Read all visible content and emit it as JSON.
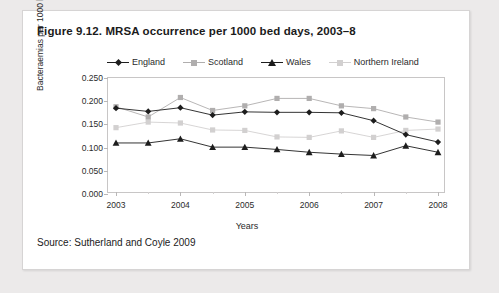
{
  "figure": {
    "title": "Figure 9.12. MRSA occurrence per 1000 bed days, 2003–8",
    "source": "Source: Sutherland and Coyle 2009"
  },
  "legend": {
    "position": "top",
    "items": [
      {
        "label": "England",
        "marker": "diamond",
        "color": "#1d1d1d"
      },
      {
        "label": "Scotland",
        "marker": "square",
        "color": "#b0aeae"
      },
      {
        "label": "Wales",
        "marker": "triangle",
        "color": "#1d1d1d"
      },
      {
        "label": "Northern Ireland",
        "marker": "square",
        "color": "#d2d0d0"
      }
    ]
  },
  "chart_data": {
    "type": "line",
    "title": "Figure 9.12. MRSA occurrence per 1000 bed days, 2003–8",
    "xlabel": "Years",
    "ylabel": "Bacteraemias per 1000 bed days",
    "xlim": [
      2003,
      2008
    ],
    "ylim": [
      0.0,
      0.25
    ],
    "ytick_labels": [
      "0.000",
      "0.050",
      "0.100",
      "0.150",
      "0.200",
      "0.250"
    ],
    "ytick_values": [
      0.0,
      0.05,
      0.1,
      0.15,
      0.2,
      0.25
    ],
    "xtick_labels": [
      "2003",
      "2004",
      "2005",
      "2006",
      "2007",
      "2008"
    ],
    "xtick_values": [
      2003,
      2004,
      2005,
      2006,
      2007,
      2008
    ],
    "grid": false,
    "legend_position": "top",
    "x": [
      2003,
      2003.5,
      2004,
      2004.5,
      2005,
      2005.5,
      2006,
      2006.5,
      2007,
      2007.5,
      2008
    ],
    "series": [
      {
        "name": "England",
        "marker": "diamond",
        "color": "#1d1d1d",
        "values": [
          0.185,
          0.178,
          0.186,
          0.17,
          0.177,
          0.176,
          0.176,
          0.175,
          0.158,
          0.128,
          0.112
        ]
      },
      {
        "name": "Scotland",
        "marker": "square",
        "color": "#b0aeae",
        "values": [
          0.188,
          0.166,
          0.208,
          0.18,
          0.19,
          0.206,
          0.206,
          0.19,
          0.184,
          0.166,
          0.155
        ]
      },
      {
        "name": "Wales",
        "marker": "triangle",
        "color": "#1d1d1d",
        "values": [
          0.11,
          0.11,
          0.119,
          0.101,
          0.101,
          0.096,
          0.09,
          0.086,
          0.083,
          0.104,
          0.09
        ]
      },
      {
        "name": "Northern Ireland",
        "marker": "square",
        "color": "#d2d0d0",
        "values": [
          0.143,
          0.155,
          0.153,
          0.138,
          0.137,
          0.123,
          0.122,
          0.136,
          0.122,
          0.137,
          0.14
        ]
      }
    ]
  }
}
